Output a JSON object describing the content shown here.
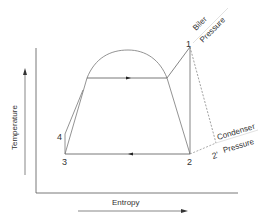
{
  "diagram": {
    "type": "T-s diagram (Rankine cycle)",
    "axes": {
      "y_label": "Temperature",
      "x_label": "Entropy"
    },
    "points": {
      "p1": "1",
      "p2": "2",
      "p2prime": "2'",
      "p3": "3",
      "p4": "4"
    },
    "annotations": {
      "boiler_line1": "Biler",
      "boiler_line2": "Pressure",
      "condenser_line1": "Condenser",
      "condenser_line2": "Pressure"
    },
    "colors": {
      "line": "#666666",
      "text": "#333333",
      "pressure_line": "#bbbbbb"
    }
  }
}
